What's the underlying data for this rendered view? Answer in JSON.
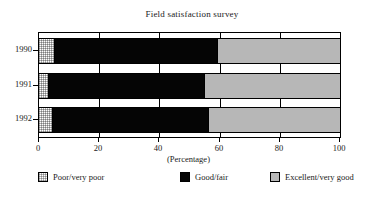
{
  "chart_data": {
    "type": "bar",
    "orientation": "horizontal",
    "stacked": true,
    "stacked_percent": true,
    "title": "Field satisfaction survey",
    "xlabel": "(Percentage)",
    "ylabel": "",
    "xlim": [
      0,
      100
    ],
    "xticks": [
      0,
      20,
      40,
      60,
      80,
      100
    ],
    "xtick_labels": [
      "0",
      "20",
      "40",
      "60",
      "80",
      "100"
    ],
    "categories": [
      "1990",
      "1991",
      "1992"
    ],
    "grid": true,
    "grid_axis": "x",
    "legend_position": "bottom",
    "series": [
      {
        "name": "Poor/very poor",
        "color": "#ffffff",
        "pattern": "fine-dotted",
        "values": [
          5.3,
          3.3,
          4.7
        ]
      },
      {
        "name": "Good/fair",
        "color": "#050505",
        "pattern": "solid",
        "values": [
          54.3,
          51.7,
          51.8
        ]
      },
      {
        "name": "Excellent/very good",
        "color": "#b7b7b7",
        "pattern": "solid",
        "values": [
          40.4,
          45.0,
          43.5
        ]
      }
    ],
    "cumulative_boundaries": [
      [
        5.3,
        59.6
      ],
      [
        3.3,
        55.0
      ],
      [
        4.7,
        56.5
      ]
    ]
  },
  "legend": {
    "items": [
      {
        "label": "Poor/very poor",
        "swatch": "swatch-poor",
        "left": 6
      },
      {
        "label": "Good/fair",
        "swatch": "swatch-good",
        "left": 148
      },
      {
        "label": "Excellent/very good",
        "swatch": "swatch-excellent",
        "left": 238
      }
    ]
  }
}
